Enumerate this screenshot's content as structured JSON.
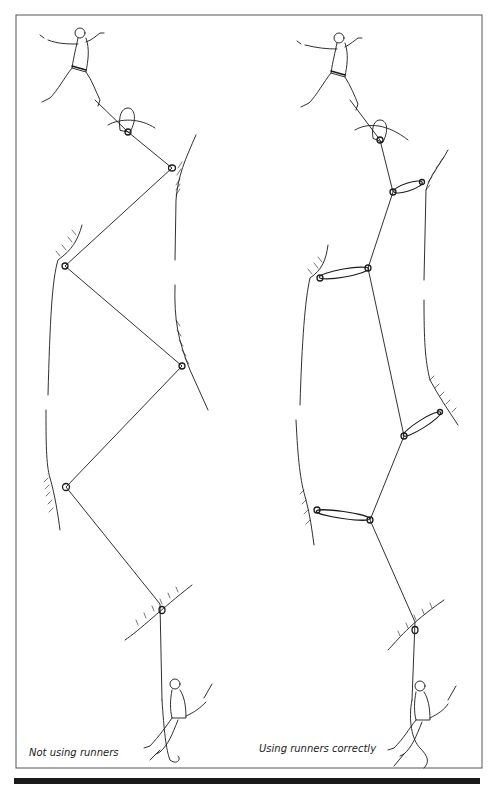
{
  "figure": {
    "type": "line-illustration",
    "colors": {
      "ink": "#1a1a1a",
      "frame": "#555555",
      "background": "#ffffff"
    },
    "panels": [
      {
        "id": "left",
        "caption": "Not using runners",
        "leader": "climber-leading",
        "belayer": "belayer-seated",
        "rope_path": [
          [
            128,
            132
          ],
          [
            172,
            168
          ],
          [
            65,
            266
          ],
          [
            182,
            366
          ],
          [
            66,
            487
          ],
          [
            160,
            604
          ],
          [
            162,
            700
          ]
        ],
        "protection_points": [
          {
            "x": 128,
            "y": 132,
            "kind": "sling-on-spike"
          },
          {
            "x": 172,
            "y": 168,
            "kind": "nut-direct"
          },
          {
            "x": 65,
            "y": 266,
            "kind": "nut-direct"
          },
          {
            "x": 182,
            "y": 366,
            "kind": "nut-direct"
          },
          {
            "x": 66,
            "y": 487,
            "kind": "nut-direct"
          },
          {
            "x": 160,
            "y": 610,
            "kind": "thread-belay"
          }
        ]
      },
      {
        "id": "right",
        "caption": "Using runners correctly",
        "leader": "climber-leading",
        "belayer": "belayer-seated",
        "rope_path": [
          [
            380,
            140
          ],
          [
            393,
            192
          ],
          [
            368,
            268
          ],
          [
            404,
            436
          ],
          [
            370,
            520
          ],
          [
            415,
            622
          ],
          [
            412,
            700
          ]
        ],
        "protection_points": [
          {
            "x": 380,
            "y": 140,
            "kind": "sling-on-spike"
          },
          {
            "x": 393,
            "y": 192,
            "kind": "extended-runner",
            "anchor": [
              422,
              182
            ]
          },
          {
            "x": 368,
            "y": 268,
            "kind": "extended-runner",
            "anchor": [
              320,
              278
            ]
          },
          {
            "x": 404,
            "y": 436,
            "kind": "extended-runner",
            "anchor": [
              440,
              412
            ]
          },
          {
            "x": 370,
            "y": 520,
            "kind": "extended-runner",
            "anchor": [
              317,
              510
            ]
          },
          {
            "x": 415,
            "y": 630,
            "kind": "thread-belay"
          }
        ]
      }
    ]
  },
  "captions": {
    "left": "Not using runners",
    "right": "Using runners correctly"
  }
}
